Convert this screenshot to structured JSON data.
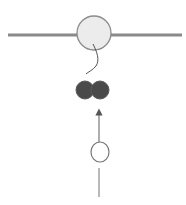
{
  "diagram": {
    "width": 186,
    "height": 205,
    "colors": {
      "background": "#ffffff",
      "strand": "#8a8a8a",
      "large_circle_fill": "#ececec",
      "large_circle_stroke": "#8c8c8c",
      "dark_circle_fill": "#4a4a4a",
      "dark_circle_stroke": "#5a5a5a",
      "connector": "#555555",
      "small_circle_stroke": "#777777",
      "arrow": "#777777"
    },
    "elements": [
      {
        "id": "horizontal-strand",
        "type": "line",
        "x1": 8,
        "y1": 35,
        "x2": 182,
        "y2": 35
      },
      {
        "id": "large-circle",
        "type": "circle",
        "cx": 94,
        "cy": 33,
        "r": 17
      },
      {
        "id": "connector-curve",
        "type": "curve"
      },
      {
        "id": "dark-circle-left",
        "type": "circle",
        "cx": 85,
        "cy": 90,
        "r": 9
      },
      {
        "id": "dark-circle-right",
        "type": "circle",
        "cx": 100,
        "cy": 90,
        "r": 9
      },
      {
        "id": "up-arrow",
        "type": "arrow",
        "x": 99,
        "y_from": 142,
        "y_to": 109
      },
      {
        "id": "small-open-circle",
        "type": "circle",
        "cx": 100,
        "cy": 152,
        "r": 9
      },
      {
        "id": "vertical-stem",
        "type": "line",
        "x1": 99,
        "y1": 168,
        "x2": 99,
        "y2": 197
      }
    ]
  }
}
